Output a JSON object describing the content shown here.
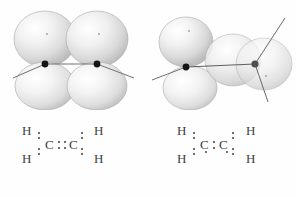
{
  "figure": {
    "background_color": "#ffffff",
    "lobe_color": "#d9d9d9",
    "lobe_highlight_color": "#ffffff",
    "lobe_edge_color": "#9a9a9a",
    "nucleus_color": "#141414",
    "axis_color": "#6a6a6a",
    "text_color": "#404040",
    "panels": [
      {
        "id": "planar",
        "caption_alt": "Planar ethene, p orbitals aligned, pi bond intact",
        "orbital": {
          "description": "Two pairs of parallel p-orbital lobes above and below the C-C axis",
          "lobe_count": 4,
          "nuclei": 2,
          "twist_degrees": 0
        },
        "lewis": {
          "formula": "H2C::CH2",
          "central_atoms": [
            "C",
            "C"
          ],
          "terminal_atoms": [
            "H",
            "H",
            "H",
            "H"
          ],
          "bond_between_carbons": "double",
          "carbon_bond_dots": 4,
          "ch_bond_pairs": 4,
          "labels": {
            "h_top_left": "H",
            "h_bottom_left": "H",
            "c_left": "C",
            "c_right": "C",
            "h_top_right": "H",
            "h_bottom_right": "H"
          }
        }
      },
      {
        "id": "twisted",
        "caption_alt": "Ethene twisted 90 degrees, p orbitals perpendicular, pi bond broken",
        "orbital": {
          "description": "Left carbon p orbital vertical, right carbon p orbital rotated 90 degrees into the page",
          "lobe_count": 4,
          "nuclei": 2,
          "twist_degrees": 90
        },
        "lewis": {
          "formula": "H2C:CH2",
          "central_atoms": [
            "C",
            "C"
          ],
          "terminal_atoms": [
            "H",
            "H",
            "H",
            "H"
          ],
          "bond_between_carbons": "single",
          "carbon_bond_dots": 2,
          "ch_bond_pairs": 4,
          "radical_dots": 2,
          "labels": {
            "h_top_left": "H",
            "h_bottom_left": "H",
            "c_left": "C",
            "c_right": "C",
            "h_top_right": "H",
            "h_bottom_right": "H"
          }
        }
      }
    ]
  }
}
